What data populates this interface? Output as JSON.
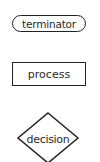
{
  "diagram": {
    "type": "flowchart-legend",
    "stroke_color": "#222222",
    "text_color": "#2a2a2a",
    "background": "#ffffff",
    "shapes": [
      {
        "kind": "terminator",
        "label": "terminator"
      },
      {
        "kind": "process",
        "label": "process"
      },
      {
        "kind": "decision",
        "label": "decision"
      }
    ]
  }
}
